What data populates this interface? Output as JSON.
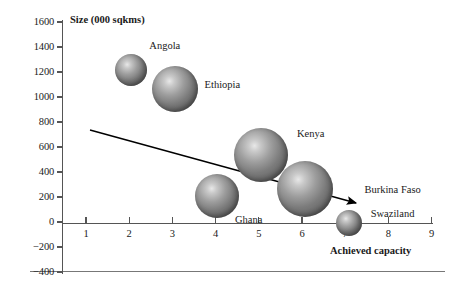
{
  "chart_data": {
    "type": "scatter",
    "title": "",
    "xlabel": "Achieved capacity",
    "ylabel": "Size (000 sqkms)",
    "xlim": [
      0,
      9
    ],
    "ylim": [
      -400,
      1600
    ],
    "x_ticks": [
      1,
      2,
      3,
      4,
      5,
      6,
      7,
      8,
      9
    ],
    "y_ticks": [
      1600,
      1400,
      1200,
      1000,
      800,
      600,
      400,
      200,
      0,
      -200,
      -400
    ],
    "grid": false,
    "legend": "none",
    "bubbles": [
      {
        "name": "Angola",
        "x": 2.05,
        "y": 1220,
        "r_px": 16,
        "label_dx": 18,
        "label_dy": -24
      },
      {
        "name": "Ethiopia",
        "x": 3.05,
        "y": 1065,
        "r_px": 23,
        "label_dx": 30,
        "label_dy": -4
      },
      {
        "name": "Kenya",
        "x": 5.05,
        "y": 540,
        "r_px": 27,
        "label_dx": 36,
        "label_dy": -21
      },
      {
        "name": "Ghana",
        "x": 4.03,
        "y": 205,
        "r_px": 22,
        "label_dx": 18,
        "label_dy": 23
      },
      {
        "name": "Burkina Faso",
        "x": 6.08,
        "y": 265,
        "r_px": 28,
        "label_dx": 59,
        "label_dy": 1
      },
      {
        "name": "Swaziland",
        "x": 7.08,
        "y": -10,
        "r_px": 13,
        "label_dx": 22,
        "label_dy": -10
      }
    ],
    "trendline": {
      "label": "trend-arrow",
      "x1_px": 90,
      "y1_px": 130,
      "x2_px": 356,
      "y2_px": 203,
      "arrowhead": true
    },
    "annotations": []
  },
  "axes": {
    "y_axis_px": {
      "left": 62,
      "top": 20,
      "height": 254
    },
    "x_axis_px": {
      "left": 62,
      "top": 222.5,
      "width": 371
    },
    "y_scale": {
      "value_top": 1600,
      "y_top_px": 22,
      "px_per_unit": 0.125
    },
    "x_scale": {
      "value_first": 1,
      "x_first_px": 86,
      "px_per_unit": 43.2
    }
  },
  "colors": {
    "axis": "#555555",
    "bubble_dark": "#5e5e5e",
    "bubble_light": "#e8e8e8",
    "text": "#1a1a1a",
    "trend": "#000000",
    "background": "#ffffff"
  }
}
